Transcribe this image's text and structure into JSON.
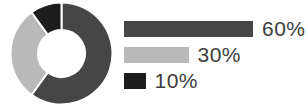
{
  "chart_data": {
    "type": "pie",
    "subtype": "donut",
    "slices": [
      {
        "label": "60%",
        "value": 60,
        "color": "#464646"
      },
      {
        "label": "30%",
        "value": 30,
        "color": "#b9b9b9"
      },
      {
        "label": "10%",
        "value": 10,
        "color": "#1d1d1d"
      }
    ],
    "start_angle_deg": 0,
    "direction": "clockwise",
    "donut_hole_ratio": 0.46,
    "segment_gap_color": "#ffffff",
    "legend_position": "right",
    "legend_style": "proportional-bars",
    "label_color": "#3d3d3d"
  }
}
